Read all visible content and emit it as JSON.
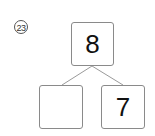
{
  "problem": {
    "number_label": "23",
    "top_value": "8",
    "left_value": "",
    "right_value": "7"
  }
}
